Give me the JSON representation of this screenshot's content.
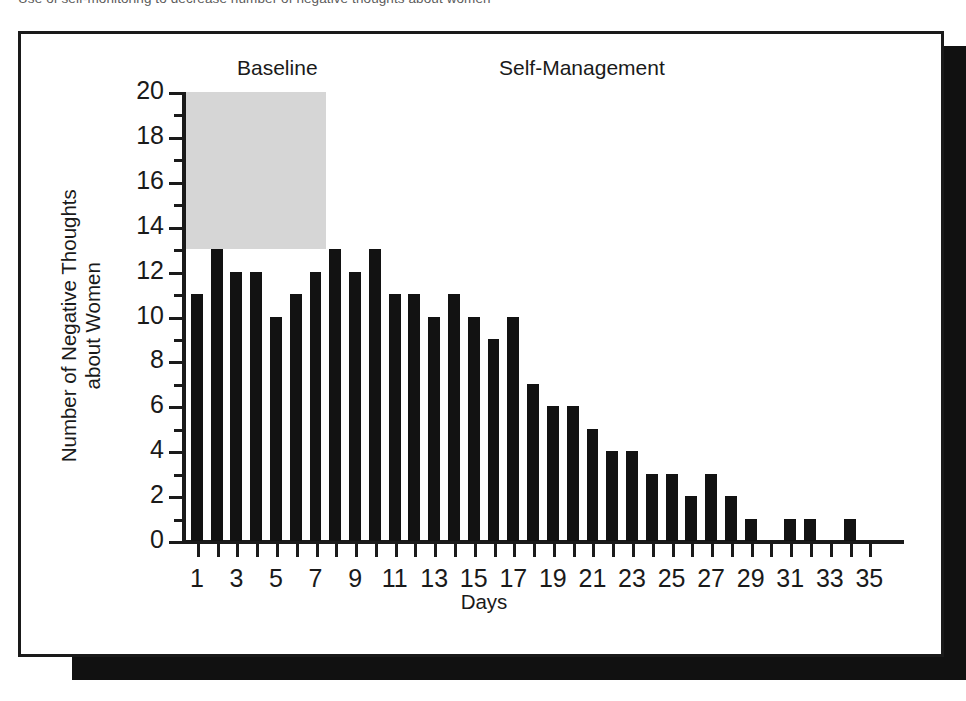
{
  "caption": {
    "text": "Use of self-monitoring to decrease number of negative thoughts about women"
  },
  "figure": {
    "phase_labels": {
      "baseline": "Baseline",
      "treatment": "Self-Management"
    }
  },
  "chart_data": {
    "type": "bar",
    "title": "",
    "xlabel": "Days",
    "ylabel": "Number of Negative Thoughts about Women",
    "ylabel_line1": "Number of Negative Thoughts",
    "ylabel_line2": "about Women",
    "ylim": [
      0,
      20
    ],
    "xlim": [
      0,
      36
    ],
    "grid": false,
    "legend": "none",
    "bar_color": "#121212",
    "shade_color": "#d6d6d6",
    "y_ticks_major": [
      0,
      2,
      4,
      6,
      8,
      10,
      12,
      14,
      16,
      18,
      20
    ],
    "y_ticks_minor": [
      1,
      3,
      5,
      7,
      9,
      11,
      13,
      15,
      17,
      19
    ],
    "x_tick_labels": [
      1,
      3,
      5,
      7,
      9,
      11,
      13,
      15,
      17,
      19,
      21,
      23,
      25,
      27,
      29,
      31,
      33,
      35
    ],
    "categories": [
      1,
      2,
      3,
      4,
      5,
      6,
      7,
      8,
      9,
      10,
      11,
      12,
      13,
      14,
      15,
      16,
      17,
      18,
      19,
      20,
      21,
      22,
      23,
      24,
      25,
      26,
      27,
      28,
      29,
      30,
      31,
      32,
      33,
      34,
      35
    ],
    "values": [
      11,
      13,
      12,
      12,
      10,
      11,
      12,
      13,
      12,
      13,
      11,
      11,
      10,
      11,
      10,
      9,
      10,
      7,
      6,
      6,
      5,
      4,
      4,
      3,
      3,
      2,
      3,
      2,
      1,
      0,
      1,
      1,
      0,
      1,
      0
    ],
    "phases": [
      {
        "name": "Baseline",
        "start_day": 1,
        "end_day": 7,
        "shaded": true
      },
      {
        "name": "Self-Management",
        "start_day": 8,
        "end_day": 35,
        "shaded": false
      }
    ]
  }
}
